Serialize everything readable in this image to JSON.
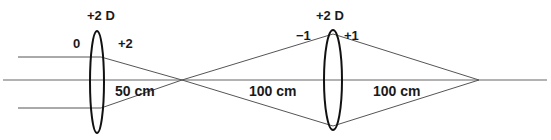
{
  "diagram": {
    "type": "two-lens optical ray diagram",
    "colors": {
      "ray": "#555555",
      "axis": "#666666",
      "lens": "#111111",
      "text": "#1a1a1a"
    },
    "lens1": {
      "power_label": "+2 D",
      "left_label": "0",
      "right_label": "+2"
    },
    "lens2": {
      "power_label": "+2 D",
      "left_label": "−1",
      "right_label": "+1"
    },
    "distances": {
      "lens1_to_focus": "50 cm",
      "focus_to_lens2": "100 cm",
      "lens2_to_image": "100 cm"
    }
  }
}
